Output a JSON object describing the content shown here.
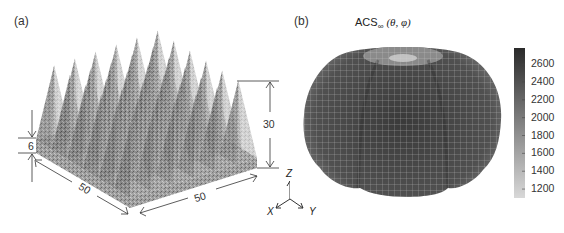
{
  "panel_a": {
    "label": "(a)",
    "dimensions": {
      "base_height": "6",
      "pyramid_height": "30",
      "side_x": "50",
      "side_y": "50"
    },
    "pyramid_grid": "6x6",
    "axes": {
      "x": "X",
      "y": "Y",
      "z": "Z"
    }
  },
  "panel_b": {
    "label": "(b)",
    "title_main": "ACS",
    "title_sub": "∞",
    "title_args": "(θ, φ)",
    "colorbar": {
      "min": 1100,
      "max": 2780,
      "ticks": [
        "2600",
        "2400",
        "2200",
        "2000",
        "1800",
        "1600",
        "1400",
        "1200"
      ],
      "color_low": "#d8d8d8",
      "color_high": "#2a2a2a"
    }
  }
}
